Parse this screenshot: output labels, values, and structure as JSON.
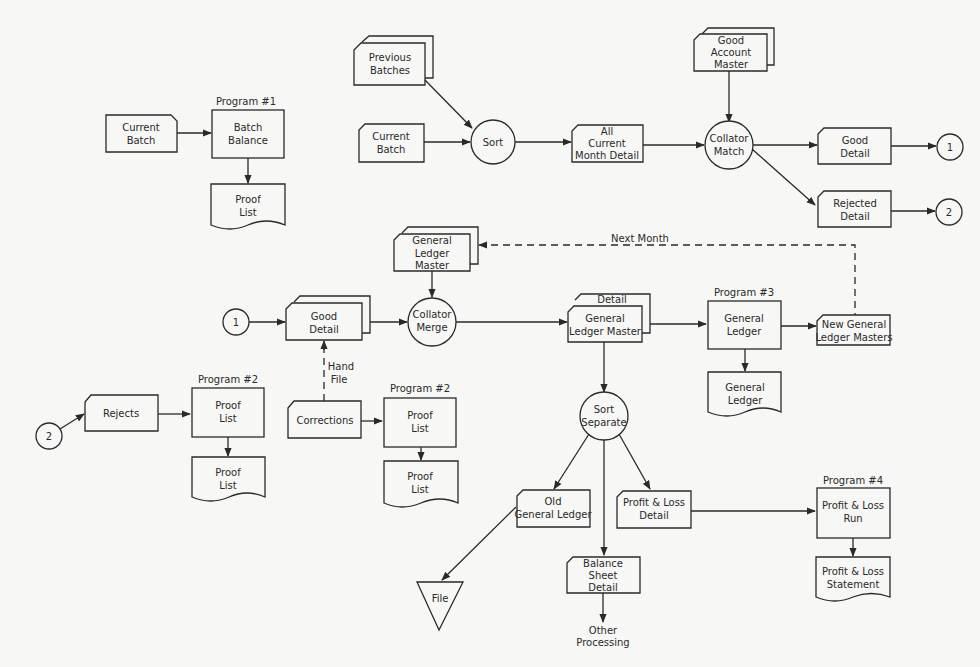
{
  "diagram": {
    "type": "system flowchart",
    "connectors": {
      "one": "1",
      "two": "2"
    },
    "program_labels": {
      "p1": "Program #1",
      "p2a": "Program #2",
      "p2b": "Program #2",
      "p3": "Program #3",
      "p4": "Program #4"
    },
    "nodes": {
      "current_batch_1": [
        "Current",
        "Batch"
      ],
      "batch_balance": [
        "Batch",
        "Balance"
      ],
      "proof_list_1": [
        "Proof",
        "List"
      ],
      "previous_batches": [
        "Previous",
        "Batches"
      ],
      "current_batch_2": [
        "Current",
        "Batch"
      ],
      "sort": [
        "Sort"
      ],
      "all_current_month_detail": [
        "All",
        "Current",
        "Month Detail"
      ],
      "good_account_master": [
        "Good",
        "Account",
        "Master"
      ],
      "collator_match": [
        "Collator",
        "Match"
      ],
      "good_detail_out": [
        "Good",
        "Detail"
      ],
      "rejected_detail": [
        "Rejected",
        "Detail"
      ],
      "general_ledger_master_in": [
        "General",
        "Ledger",
        "Master"
      ],
      "good_detail_in": [
        "Good",
        "Detail"
      ],
      "collator_merge": [
        "Collator",
        "Merge"
      ],
      "detail_gl_master_back": [
        "Detail"
      ],
      "detail_gl_master": [
        "General",
        "Ledger Master"
      ],
      "general_ledger_proc": [
        "General",
        "Ledger"
      ],
      "general_ledger_report": [
        "General",
        "Ledger"
      ],
      "new_gl_masters": [
        "New General",
        "Ledger Masters"
      ],
      "rejects": [
        "Rejects"
      ],
      "proof_list_proc_a": [
        "Proof",
        "List"
      ],
      "proof_list_doc_a": [
        "Proof",
        "List"
      ],
      "corrections": [
        "Corrections"
      ],
      "proof_list_proc_b": [
        "Proof",
        "List"
      ],
      "proof_list_doc_b": [
        "Proof",
        "List"
      ],
      "sort_separate": [
        "Sort",
        "Separate"
      ],
      "old_general_ledger": [
        "Old",
        "General Ledger"
      ],
      "file": [
        "File"
      ],
      "balance_sheet_detail": [
        "Balance",
        "Sheet",
        "Detail"
      ],
      "other_processing": [
        "Other",
        "Processing"
      ],
      "pl_detail": [
        "Profit & Loss",
        "Detail"
      ],
      "pl_run": [
        "Profit & Loss",
        "Run"
      ],
      "pl_statement": [
        "Profit & Loss",
        "Statement"
      ]
    },
    "edge_labels": {
      "next_month": "Next Month",
      "hand_file": [
        "Hand",
        "File"
      ]
    }
  }
}
